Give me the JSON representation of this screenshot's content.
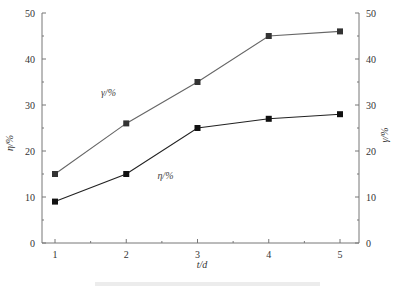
{
  "chart_data": {
    "type": "line",
    "title": "",
    "xlabel": "t/d",
    "ylabel_left": "η/%",
    "ylabel_right": "γ/%",
    "x": [
      1,
      2,
      3,
      4,
      5
    ],
    "xticks": [
      "1",
      "2",
      "3",
      "4",
      "5"
    ],
    "xlim": [
      0.8,
      5.2
    ],
    "ylim": [
      0,
      50
    ],
    "yticks": [
      "0",
      "10",
      "20",
      "30",
      "40",
      "50"
    ],
    "grid": false,
    "series": [
      {
        "name": "γ/%",
        "axis": "right",
        "values": [
          15,
          26,
          35,
          45,
          46
        ],
        "color": "#666666",
        "marker": "square"
      },
      {
        "name": "η/%",
        "axis": "left",
        "values": [
          9,
          15,
          25,
          27,
          28
        ],
        "color": "#222222",
        "marker": "square"
      }
    ],
    "annotations": [
      {
        "text": "γ/%",
        "near_series": "γ/%",
        "x": 1.75,
        "y": 32
      },
      {
        "text": "η/%",
        "near_series": "η/%",
        "x": 2.55,
        "y": 14
      }
    ]
  }
}
